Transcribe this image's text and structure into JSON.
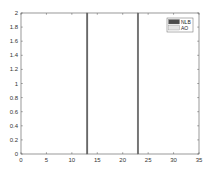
{
  "chart_data": {
    "type": "bar",
    "title": "",
    "xlabel": "",
    "ylabel": "",
    "xlim": [
      0,
      35
    ],
    "ylim": [
      0,
      2
    ],
    "xticks": [
      0,
      5,
      10,
      15,
      20,
      25,
      30,
      35
    ],
    "yticks": [
      0,
      0.2,
      0.4,
      0.6,
      0.8,
      1,
      1.2,
      1.4,
      1.6,
      1.8,
      2
    ],
    "xtick_labels": [
      "0",
      "5",
      "10",
      "15",
      "20",
      "25",
      "30",
      "35"
    ],
    "ytick_labels": [
      "0",
      "0.2",
      "0.4",
      "0.6",
      "0.8",
      "1",
      "1.2",
      "1.4",
      "1.6",
      "1.8",
      "2"
    ],
    "grid": false,
    "legend_position": "upper right",
    "series": [
      {
        "name": "NLB",
        "color": "#4d4d4d",
        "x": [
          13,
          23
        ],
        "values": [
          2,
          2
        ]
      },
      {
        "name": "AO",
        "color": "#e6e6e6",
        "x": [
          13,
          23
        ],
        "values": [
          0,
          0
        ]
      }
    ]
  },
  "plot": {
    "left": 21,
    "right": 199,
    "top": 13,
    "bottom": 154,
    "axis_color": "#555555",
    "bar_width_units": 0.7
  },
  "legend": {
    "items": [
      {
        "label": "NLB",
        "swatch": "#4d4d4d"
      },
      {
        "label": "AO",
        "swatch": "#e6e6e6"
      }
    ]
  }
}
